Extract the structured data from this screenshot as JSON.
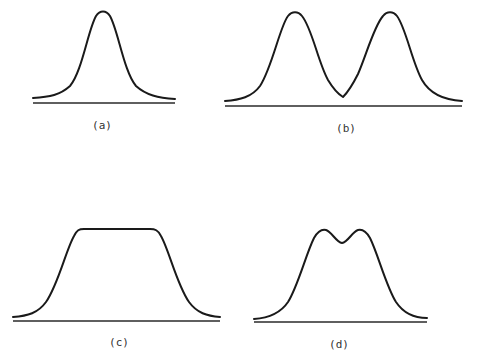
{
  "figure": {
    "panels": [
      {
        "id": "a",
        "label": "(a)",
        "shape": "single-peak"
      },
      {
        "id": "b",
        "label": "(b)",
        "shape": "two-separated-peaks"
      },
      {
        "id": "c",
        "label": "(c)",
        "shape": "flat-top-plateau"
      },
      {
        "id": "d",
        "label": "(d)",
        "shape": "two-overlapping-peaks"
      }
    ],
    "stroke_color": "#1a1a1a",
    "background_color": "#ffffff"
  }
}
